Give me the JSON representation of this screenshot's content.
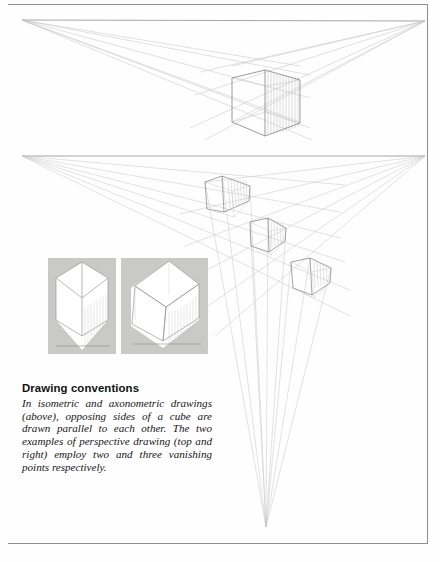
{
  "page": {
    "background_color": "#fefefe",
    "border_color": "#8e8e8e",
    "panel_gray": "#c9c9c7",
    "line_color": "#9a9a9a",
    "ink_color": "#6f6f6f"
  },
  "caption": {
    "heading": "Drawing conventions",
    "body": "In isometric and axonometric drawings (above), opposing sides of a cube are drawn parallel to each other. The two examples of perspective drawing (top and right) employ two and three vanishing points respectively."
  },
  "figures": {
    "two_point": {
      "label": "two-point perspective construction",
      "horizon_y": 20,
      "vanishing_points": [
        {
          "name": "left",
          "x": 22,
          "y": 20
        },
        {
          "name": "right",
          "x": 425,
          "y": 21
        }
      ],
      "cube": {
        "x": 232,
        "y": 66,
        "width": 68,
        "height": 56,
        "shading": "vertical hatching on right face"
      }
    },
    "three_point": {
      "label": "three-point perspective construction",
      "horizon_y": 156,
      "vanishing_points": [
        {
          "name": "left",
          "x": 22,
          "y": 156
        },
        {
          "name": "right",
          "x": 425,
          "y": 156
        },
        {
          "name": "bottom",
          "x": 266,
          "y": 527
        }
      ],
      "cubes": [
        {
          "name": "upper",
          "x": 205,
          "y": 182,
          "width": 45,
          "height": 30
        },
        {
          "name": "middle",
          "x": 250,
          "y": 222,
          "width": 36,
          "height": 30
        },
        {
          "name": "lower",
          "x": 291,
          "y": 258,
          "width": 40,
          "height": 37
        }
      ]
    },
    "panels": [
      {
        "name": "isometric-drawing",
        "title": "isometric",
        "x": 48,
        "y": 258,
        "width": 68,
        "height": 96,
        "description": "cube drawn in isometric projection, hexagonal silhouette, vertical hatching on right face"
      },
      {
        "name": "axonometric-drawing",
        "title": "axonometric",
        "x": 121,
        "y": 258,
        "width": 87,
        "height": 96,
        "description": "cube drawn in axonometric projection, tilted plan, vertical hatching on right face"
      }
    ]
  }
}
